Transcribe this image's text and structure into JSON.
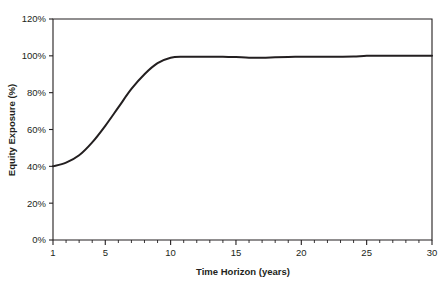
{
  "chart_data": {
    "type": "line",
    "title": "",
    "xlabel": "Time Horizon (years)",
    "ylabel": "Equity Exposure (%)",
    "xlim": [
      1,
      30
    ],
    "ylim": [
      0,
      120
    ],
    "grid": false,
    "legend": null,
    "x_ticks": [
      1,
      5,
      10,
      15,
      20,
      25,
      30
    ],
    "x_tick_labels": [
      "1",
      "5",
      "10",
      "15",
      "20",
      "25",
      "30"
    ],
    "x_minor_step": 1,
    "y_ticks": [
      0,
      20,
      40,
      60,
      80,
      100,
      120
    ],
    "y_tick_labels": [
      "0%",
      "20%",
      "40%",
      "60%",
      "80%",
      "100%",
      "120%"
    ],
    "series": [
      {
        "name": "Equity Exposure",
        "color": "#231f20",
        "x": [
          1,
          2,
          3,
          4,
          5,
          6,
          7,
          8,
          9,
          10,
          11,
          12,
          13,
          14,
          15,
          16,
          17,
          18,
          19,
          20,
          21,
          22,
          23,
          24,
          25,
          26,
          27,
          28,
          29,
          30
        ],
        "values": [
          40,
          42,
          46,
          53,
          62,
          72,
          82,
          90,
          96,
          99,
          99.5,
          99.5,
          99.5,
          99.5,
          99.3,
          99,
          99,
          99.2,
          99.4,
          99.5,
          99.5,
          99.5,
          99.5,
          99.6,
          100,
          100,
          100,
          100,
          100,
          100
        ]
      }
    ]
  },
  "axis": {
    "x_title": "Time Horizon (years)",
    "y_title": "Equity Exposure (%)"
  },
  "tick_labels": {
    "y": [
      "120%",
      "100%",
      "80%",
      "60%",
      "40%",
      "20%",
      "0%"
    ],
    "x": [
      "1",
      "5",
      "10",
      "15",
      "20",
      "25",
      "30"
    ]
  },
  "colors": {
    "line": "#231f20",
    "axis": "#231f20",
    "background": "#ffffff"
  }
}
